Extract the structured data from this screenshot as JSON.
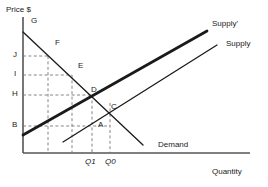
{
  "figure": {
    "title_hidden": "",
    "width": 268,
    "height": 187,
    "background": "#ffffff"
  },
  "axes": {
    "y_axis_label": "Price $",
    "x_axis_label": "Quantity",
    "axis_color": "#555555",
    "origin": {
      "x": 23,
      "y": 153
    },
    "y_top": 17,
    "x_right": 250
  },
  "price_ticks": [
    {
      "label": "J",
      "y": 56,
      "dash_to_x": 48
    },
    {
      "label": "I",
      "y": 75,
      "dash_to_x": 72
    },
    {
      "label": "H",
      "y": 95,
      "dash_to_x": 92
    },
    {
      "label": "B",
      "y": 126,
      "dash_to_x": 110
    }
  ],
  "quantity_ticks": [
    {
      "label": "Q1",
      "x": 92
    },
    {
      "label": "Q0",
      "x": 110
    }
  ],
  "curves": [
    {
      "name": "Demand",
      "label": "Demand",
      "label_x": 158,
      "label_y": 141,
      "color": "#1a1a1a",
      "width": 1.2,
      "x1": 23,
      "y1": 32,
      "x2": 143,
      "y2": 145
    },
    {
      "name": "Supply-shifted",
      "label": "Supply'",
      "label_x": 212,
      "label_y": 20,
      "color": "#1a1a1a",
      "width": 2.6,
      "x1": 23,
      "y1": 135,
      "x2": 207,
      "y2": 31
    },
    {
      "name": "Supply-original",
      "label": "Supply",
      "label_x": 226,
      "label_y": 40,
      "color": "#1a1a1a",
      "width": 1.2,
      "x1": 63,
      "y1": 142,
      "x2": 217,
      "y2": 45
    }
  ],
  "points": [
    {
      "label": "G",
      "x": 31,
      "y": 17
    },
    {
      "label": "F",
      "x": 55,
      "y": 39
    },
    {
      "label": "E",
      "x": 78,
      "y": 62
    },
    {
      "label": "D",
      "x": 91,
      "y": 86
    },
    {
      "label": "C",
      "x": 111,
      "y": 103
    },
    {
      "label": "A",
      "x": 98,
      "y": 121
    }
  ],
  "colors": {
    "ink": "#1a1a1a",
    "axis": "#555555",
    "dash": "#777777",
    "background": "#ffffff"
  }
}
